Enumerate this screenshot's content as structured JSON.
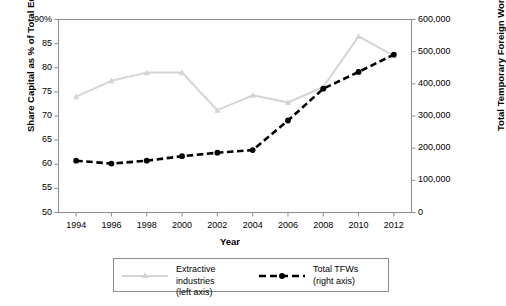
{
  "chart_data": {
    "type": "line",
    "title": "",
    "xlabel": "Year",
    "x": [
      1994,
      1996,
      1998,
      2000,
      2002,
      2004,
      2006,
      2008,
      2010,
      2012
    ],
    "xtick_labels": [
      "1994",
      "1996",
      "1998",
      "2000",
      "2002",
      "2004",
      "2006",
      "2008",
      "2010",
      "2012"
    ],
    "xlim": [
      1993,
      2013
    ],
    "grid": false,
    "legend_position": "below-axes",
    "axes": {
      "left": {
        "label": "Share Capital as % of Total Equity",
        "lim": [
          50,
          90
        ],
        "ticks": [
          50,
          55,
          60,
          65,
          70,
          75,
          80,
          85,
          90
        ],
        "tick_labels": [
          "50",
          "55",
          "60",
          "65",
          "70",
          "75",
          "80",
          "85",
          "90%"
        ]
      },
      "right": {
        "label": "Total Temporary Foreign Workers",
        "lim": [
          0,
          600000
        ],
        "ticks": [
          0,
          100000,
          200000,
          300000,
          400000,
          500000,
          600000
        ],
        "tick_labels": [
          "0",
          "100,000",
          "200,000",
          "300,000",
          "400,000",
          "500,000",
          "600,000"
        ]
      }
    },
    "series": [
      {
        "name": "Extractive industries",
        "axis": "left",
        "legend_label": "Extractive industries",
        "legend_sublabel": "(left axis)",
        "color": "#d4d4d4",
        "style": "solid",
        "marker": "triangle",
        "values": [
          74.0,
          77.3,
          79.0,
          79.0,
          71.2,
          74.3,
          72.8,
          76.0,
          86.5,
          82.5
        ]
      },
      {
        "name": "Total TFWs",
        "axis": "right",
        "legend_label": "Total TFWs",
        "legend_sublabel": "(right axis)",
        "color": "#000000",
        "style": "dashed",
        "marker": "circle",
        "values": [
          161000,
          152000,
          161000,
          175000,
          186000,
          194000,
          286000,
          385000,
          437000,
          491000
        ]
      }
    ]
  }
}
